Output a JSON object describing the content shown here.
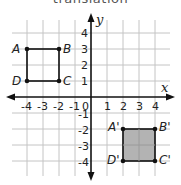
{
  "title": "translation",
  "axes": {
    "x_label": "x",
    "y_label": "y",
    "x_ticks": [
      "-4",
      "-3",
      "-2",
      "-1",
      "0",
      "1",
      "2",
      "3",
      "4"
    ],
    "y_ticks_positive": [
      "4",
      "3",
      "2",
      "1"
    ],
    "y_ticks_negative": [
      "-1",
      "-2",
      "-3",
      "-4"
    ]
  },
  "figures": {
    "original": {
      "name": "ABCD",
      "fill": "none",
      "vertices": [
        {
          "label": "A",
          "x": -4,
          "y": 3
        },
        {
          "label": "B",
          "x": -2,
          "y": 3
        },
        {
          "label": "C",
          "x": -2,
          "y": 1
        },
        {
          "label": "D",
          "x": -4,
          "y": 1
        }
      ]
    },
    "image": {
      "name": "A'B'C'D'",
      "fill": "#b3b3b3",
      "vertices": [
        {
          "label": "A'",
          "x": 2,
          "y": -2
        },
        {
          "label": "B'",
          "x": 4,
          "y": -2
        },
        {
          "label": "C'",
          "x": 4,
          "y": -4
        },
        {
          "label": "D'",
          "x": 2,
          "y": -4
        }
      ]
    }
  },
  "colors": {
    "grid": "#c4c4c4",
    "axis": "#111111",
    "image_fill": "#b3b3b3",
    "outline": "#111111"
  }
}
